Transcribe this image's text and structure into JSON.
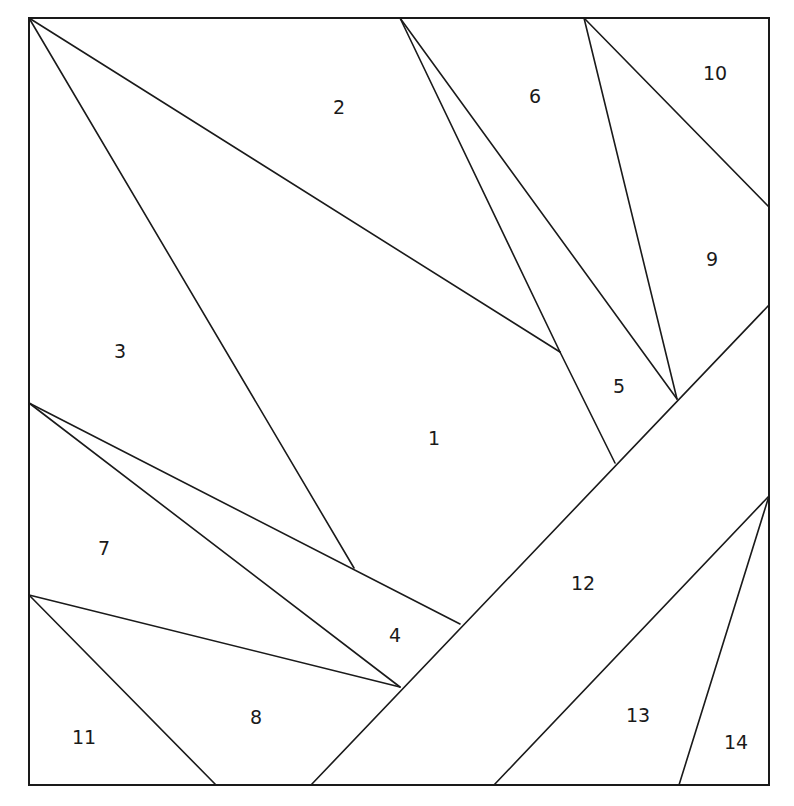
{
  "diagram": {
    "type": "paper-piecing-pattern",
    "frame": {
      "x1": 29,
      "y1": 18,
      "x2": 769,
      "y2": 785
    },
    "lines": [
      {
        "id": "a",
        "x1": 29,
        "y1": 18,
        "x2": 560,
        "y2": 352
      },
      {
        "id": "b",
        "x1": 29,
        "y1": 18,
        "x2": 354,
        "y2": 568
      },
      {
        "id": "c",
        "x1": 400,
        "y1": 18,
        "x2": 560,
        "y2": 352
      },
      {
        "id": "d",
        "x1": 560,
        "y1": 352,
        "x2": 615,
        "y2": 463
      },
      {
        "id": "e",
        "x1": 400,
        "y1": 18,
        "x2": 677,
        "y2": 399
      },
      {
        "id": "f",
        "x1": 584,
        "y1": 18,
        "x2": 677,
        "y2": 399
      },
      {
        "id": "g",
        "x1": 584,
        "y1": 18,
        "x2": 769,
        "y2": 207
      },
      {
        "id": "h",
        "x1": 769,
        "y1": 305,
        "x2": 311,
        "y2": 785
      },
      {
        "id": "i",
        "x1": 29,
        "y1": 403,
        "x2": 460,
        "y2": 624
      },
      {
        "id": "j",
        "x1": 29,
        "y1": 403,
        "x2": 400,
        "y2": 687
      },
      {
        "id": "k",
        "x1": 29,
        "y1": 595,
        "x2": 400,
        "y2": 687
      },
      {
        "id": "l",
        "x1": 29,
        "y1": 595,
        "x2": 216,
        "y2": 785
      },
      {
        "id": "m",
        "x1": 769,
        "y1": 496,
        "x2": 494,
        "y2": 785
      },
      {
        "id": "n",
        "x1": 769,
        "y1": 496,
        "x2": 679,
        "y2": 785
      }
    ],
    "pieces": [
      {
        "label": "1",
        "x": 434,
        "y": 438
      },
      {
        "label": "2",
        "x": 339,
        "y": 107
      },
      {
        "label": "3",
        "x": 120,
        "y": 351
      },
      {
        "label": "4",
        "x": 395,
        "y": 635
      },
      {
        "label": "5",
        "x": 619,
        "y": 386
      },
      {
        "label": "6",
        "x": 535,
        "y": 96
      },
      {
        "label": "7",
        "x": 104,
        "y": 548
      },
      {
        "label": "8",
        "x": 256,
        "y": 717
      },
      {
        "label": "9",
        "x": 712,
        "y": 259
      },
      {
        "label": "10",
        "x": 715,
        "y": 73
      },
      {
        "label": "11",
        "x": 84,
        "y": 737
      },
      {
        "label": "12",
        "x": 583,
        "y": 583
      },
      {
        "label": "13",
        "x": 638,
        "y": 715
      },
      {
        "label": "14",
        "x": 736,
        "y": 742
      }
    ],
    "colors": {
      "stroke": "#1a1a1a",
      "background": "#ffffff",
      "text": "#1a1a1a"
    }
  }
}
